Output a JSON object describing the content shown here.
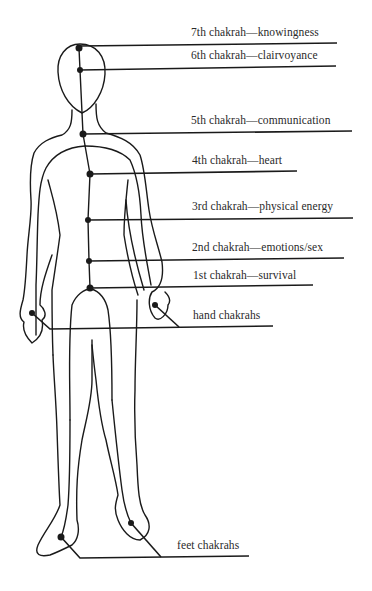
{
  "diagram": {
    "title": "",
    "colors": {
      "ink": "#1a1a1a",
      "text": "#2a2a2a",
      "background": "#ffffff"
    },
    "labels": [
      {
        "id": "7th",
        "text": "7th chakrah—knowingness",
        "x": 191,
        "y": 27
      },
      {
        "id": "6th",
        "text": "6th chakrah—clairvoyance",
        "x": 191,
        "y": 50
      },
      {
        "id": "5th",
        "text": "5th chakrah—communication",
        "x": 191,
        "y": 115
      },
      {
        "id": "4th",
        "text": "4th chakrah—heart",
        "x": 192,
        "y": 155
      },
      {
        "id": "3rd",
        "text": "3rd chakrah—physical energy",
        "x": 192,
        "y": 201
      },
      {
        "id": "2nd",
        "text": "2nd chakrah—emotions/sex",
        "x": 192,
        "y": 242
      },
      {
        "id": "1st",
        "text": "1st chakrah—survival",
        "x": 193,
        "y": 270
      },
      {
        "id": "hand",
        "text": "hand chakrahs",
        "x": 193,
        "y": 310
      },
      {
        "id": "feet",
        "text": "feet chakrahs",
        "x": 177,
        "y": 540
      }
    ],
    "chakra_points": [
      {
        "id": "7th",
        "x": 79,
        "y": 48
      },
      {
        "id": "6th",
        "x": 80,
        "y": 70
      },
      {
        "id": "5th",
        "x": 83,
        "y": 134
      },
      {
        "id": "4th",
        "x": 90,
        "y": 174
      },
      {
        "id": "3rd",
        "x": 88,
        "y": 220
      },
      {
        "id": "2nd",
        "x": 89,
        "y": 261
      },
      {
        "id": "1st",
        "x": 90,
        "y": 288
      },
      {
        "id": "hand-left",
        "x": 32,
        "y": 313
      },
      {
        "id": "hand-right",
        "x": 155,
        "y": 305
      },
      {
        "id": "foot-left",
        "x": 61,
        "y": 537
      },
      {
        "id": "foot-right",
        "x": 131,
        "y": 523
      }
    ]
  }
}
